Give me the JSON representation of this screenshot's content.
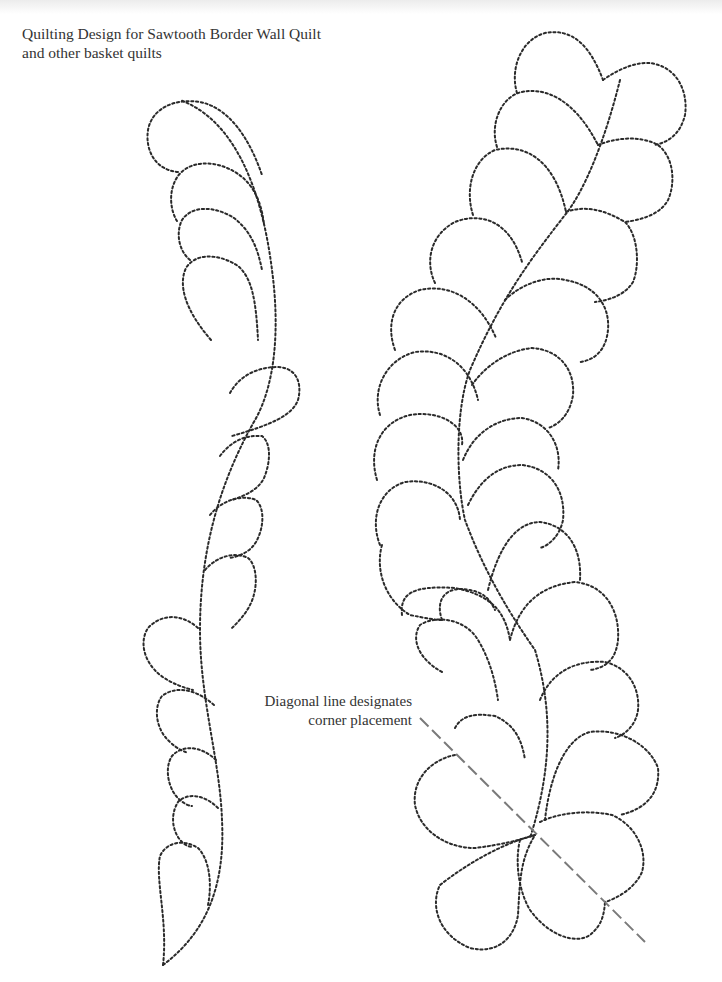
{
  "title": {
    "line1": "Quilting Design for  Sawtooth Border Wall Quilt",
    "line2": "and other basket quilts"
  },
  "annotation": {
    "line1": "Diagonal line designates",
    "line2": "corner placement"
  },
  "colors": {
    "stitch": "#2a2a2a",
    "diagonal": "#7a7a7a",
    "text": "#333333",
    "background": "#ffffff"
  },
  "designs": [
    {
      "name": "left-feather-border",
      "plume_count": 13
    },
    {
      "name": "right-feather-border",
      "plume_count": 22
    }
  ]
}
